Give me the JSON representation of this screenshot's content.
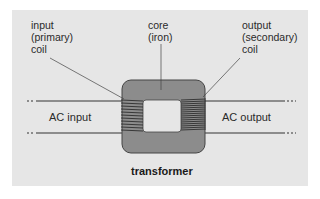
{
  "diagram": {
    "title": "transformer",
    "labels": {
      "input_coil": [
        "input",
        "(primary)",
        "coil"
      ],
      "core": [
        "core",
        "(iron)"
      ],
      "output_coil": [
        "output",
        "(secondary)",
        "coil"
      ],
      "ac_input": "AC input",
      "ac_output": "AC output"
    },
    "colors": {
      "background": "#e6e6e6",
      "core_fill": "#8c8c8c",
      "core_window": "#e6e6e6",
      "winding": "#222222",
      "line": "#333333"
    }
  }
}
